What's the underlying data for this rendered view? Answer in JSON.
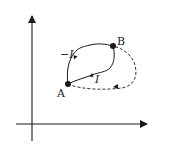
{
  "diagram": {
    "type": "path-diagram",
    "points": [
      {
        "id": "A",
        "label": "A"
      },
      {
        "id": "B",
        "label": "B"
      }
    ],
    "paths": [
      {
        "id": "solid-upper",
        "from": "B",
        "to": "A",
        "style": "solid",
        "label": "−I"
      },
      {
        "id": "solid-lower",
        "from": "A",
        "to": "B",
        "style": "solid",
        "label": "I"
      },
      {
        "id": "dashed",
        "from": "A",
        "to": "B",
        "style": "dashed",
        "label": ""
      }
    ],
    "axes": {
      "x": "",
      "y": ""
    },
    "colors": {
      "line": "#1a1a1a",
      "background": "#ffffff"
    }
  }
}
